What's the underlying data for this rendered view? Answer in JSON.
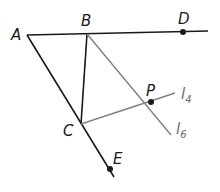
{
  "diagram": {
    "colors": {
      "black_line": "#1a1a1a",
      "gray_line": "#808080",
      "background": "#ffffff"
    },
    "points": [
      {
        "id": "A",
        "label": "A",
        "x": 27,
        "y": 35
      },
      {
        "id": "B",
        "label": "B",
        "x": 87,
        "y": 34
      },
      {
        "id": "C",
        "label": "C",
        "x": 81,
        "y": 124
      },
      {
        "id": "D",
        "label": "D",
        "x": 183,
        "y": 32
      },
      {
        "id": "E",
        "label": "E",
        "x": 110,
        "y": 169
      },
      {
        "id": "P",
        "label": "P",
        "x": 151,
        "y": 102
      }
    ],
    "lines": {
      "l4": {
        "label_main": "l",
        "label_sub": "4"
      },
      "l6": {
        "label_main": "l",
        "label_sub": "6"
      }
    },
    "labels": {
      "A": "A",
      "B": "B",
      "C": "C",
      "D": "D",
      "E": "E",
      "P": "P"
    }
  }
}
